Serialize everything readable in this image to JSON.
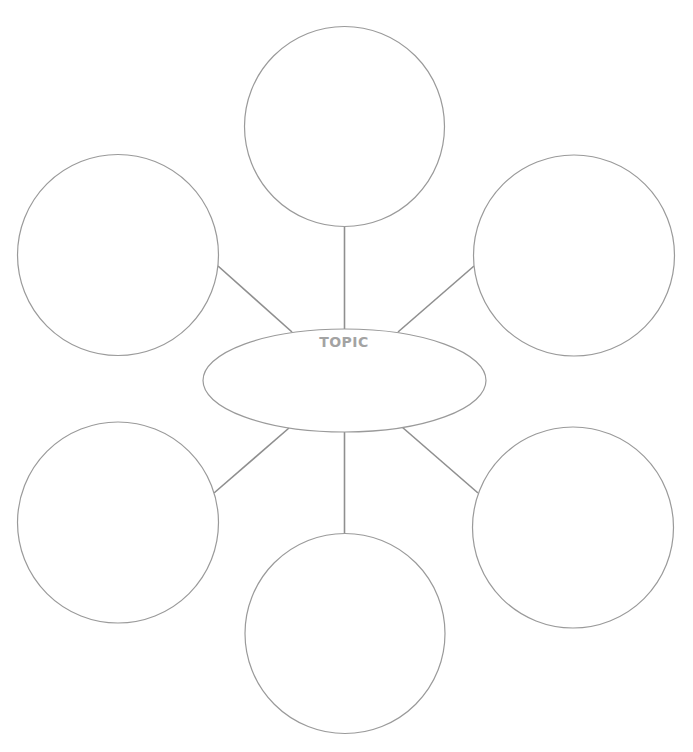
{
  "diagram": {
    "type": "bubble-map",
    "center": {
      "label": "TOPIC",
      "shape": "ellipse",
      "cx": 344.5,
      "cy": 380.5,
      "rx": 141.5,
      "ry": 51.5
    },
    "nodes": [
      {
        "id": "top",
        "label": "",
        "cx": 344.5,
        "cy": 126.5,
        "r": 100
      },
      {
        "id": "upper-left",
        "label": "",
        "cx": 118,
        "cy": 255,
        "r": 100.5
      },
      {
        "id": "upper-right",
        "label": "",
        "cx": 574,
        "cy": 255.5,
        "r": 100.5
      },
      {
        "id": "lower-left",
        "label": "",
        "cx": 118,
        "cy": 522.5,
        "r": 100.5
      },
      {
        "id": "lower-right",
        "label": "",
        "cx": 573,
        "cy": 527.5,
        "r": 100.5
      },
      {
        "id": "bottom",
        "label": "",
        "cx": 345,
        "cy": 633.5,
        "r": 100
      }
    ],
    "connectors": [
      {
        "from": "top",
        "x1": 344.5,
        "y1": 226.5,
        "x2": 344.5,
        "y2": 329
      },
      {
        "from": "upper-left",
        "x1": 218,
        "y1": 266,
        "x2": 292,
        "y2": 332
      },
      {
        "from": "upper-right",
        "x1": 474,
        "y1": 266,
        "x2": 398,
        "y2": 332
      },
      {
        "from": "lower-left",
        "x1": 214,
        "y1": 493,
        "x2": 289,
        "y2": 428
      },
      {
        "from": "lower-right",
        "x1": 478,
        "y1": 493,
        "x2": 402,
        "y2": 427
      },
      {
        "from": "bottom",
        "x1": 344.5,
        "y1": 432,
        "x2": 344.5,
        "y2": 535
      }
    ],
    "colors": {
      "stroke": "#9a9a9a",
      "connector": "#8f8f8f",
      "label": "#a3a3a3",
      "background": "#ffffff"
    }
  }
}
